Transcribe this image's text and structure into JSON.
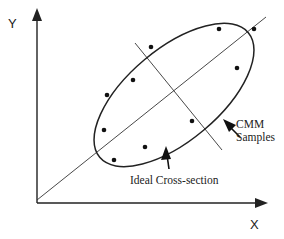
{
  "figure": {
    "axes": {
      "x_label": "X",
      "y_label": "Y"
    },
    "annotations": {
      "samples_line1": "CMM",
      "samples_line2": "Samples",
      "cross_section": "Ideal Cross-section"
    },
    "elements": {
      "ideal_cross_section": "ellipse",
      "major_axis": "diagonal line through origin",
      "minor_axis": "perpendicular line through ellipse center"
    },
    "sample_points_px": [
      [
        107,
        95
      ],
      [
        133,
        80
      ],
      [
        151,
        47
      ],
      [
        219,
        29
      ],
      [
        254,
        29
      ],
      [
        237,
        68
      ],
      [
        104,
        130
      ],
      [
        145,
        147
      ],
      [
        114,
        160
      ],
      [
        192,
        121
      ]
    ],
    "colors": {
      "ink": "#222222",
      "background": "#ffffff"
    }
  }
}
